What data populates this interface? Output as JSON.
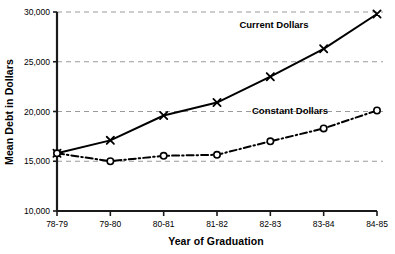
{
  "chart_data": {
    "type": "line",
    "title": "",
    "xlabel": "Year of Graduation",
    "ylabel": "Mean Debt in Dollars",
    "categories": [
      "78-79",
      "79-80",
      "80-81",
      "81-82",
      "82-83",
      "83-84",
      "84-85"
    ],
    "ylim": [
      10000,
      30000
    ],
    "yticks": [
      10000,
      15000,
      20000,
      25000,
      30000
    ],
    "ytick_labels": [
      "10,000",
      "15,000",
      "20,000",
      "25,000",
      "30,000"
    ],
    "grid": "horizontal-dashed",
    "legend": "inline-annotations",
    "series": [
      {
        "name": "Current Dollars",
        "marker": "x",
        "line_style": "solid",
        "color": "#000000",
        "values": [
          15800,
          17100,
          19600,
          20900,
          23500,
          26300,
          29800
        ]
      },
      {
        "name": "Constant Dollars",
        "marker": "o",
        "line_style": "dash-dot",
        "color": "#000000",
        "values": [
          15800,
          15000,
          15550,
          15650,
          17000,
          18300,
          20100
        ]
      }
    ],
    "annotations": [
      {
        "text": "Current Dollars",
        "series": "Current Dollars"
      },
      {
        "text": "Constant Dollars",
        "series": "Constant Dollars"
      }
    ]
  },
  "colors": {
    "background": "#ffffff",
    "axis": "#1a1a1a",
    "grid": "#9a9a9a",
    "series": "#000000"
  }
}
